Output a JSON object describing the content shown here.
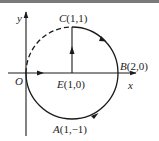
{
  "diagram": {
    "axes": {
      "x_label": "x",
      "y_label": "y",
      "origin_label": "O"
    },
    "points": {
      "C": {
        "name": "C",
        "coords": "(1,1)"
      },
      "B": {
        "name": "B",
        "coords": "(2,0)"
      },
      "E": {
        "name": "E",
        "coords": "(1,0)"
      },
      "A": {
        "name": "A",
        "coords": "(1,−1)"
      }
    },
    "circle": {
      "center": "E(1,0)",
      "radius": 1,
      "solid_arc": "from O clockwise through A, B to C",
      "dashed_arc": "from C to O (upper-left quarter)"
    },
    "colors": {
      "stroke": "#1a1a1a",
      "top_bar": "#7a7a7a"
    }
  }
}
